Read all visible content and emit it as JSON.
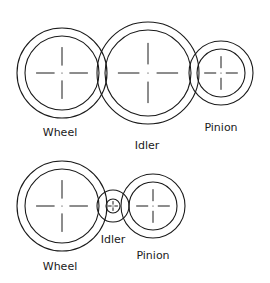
{
  "diagram": {
    "top_train": {
      "gears": [
        {
          "name": "Wheel",
          "cx": 62,
          "cy": 73,
          "r_outer": 45,
          "r_inner": 37,
          "label_x": 60,
          "label_y": 136
        },
        {
          "name": "Idler",
          "cx": 148,
          "cy": 73,
          "r_outer": 51,
          "r_inner": 43,
          "label_x": 147,
          "label_y": 149
        },
        {
          "name": "Pinion",
          "cx": 221,
          "cy": 73,
          "r_outer": 32,
          "r_inner": 24,
          "label_x": 221,
          "label_y": 131
        }
      ]
    },
    "bottom_train": {
      "gears": [
        {
          "name": "Wheel",
          "cx": 62,
          "cy": 206,
          "r_outer": 45,
          "r_inner": 37,
          "label_x": 60,
          "label_y": 270
        },
        {
          "name": "Idler",
          "cx": 113,
          "cy": 206,
          "r_outer": 16,
          "r_inner": 7,
          "label_x": 113,
          "label_y": 243
        },
        {
          "name": "Pinion",
          "cx": 153,
          "cy": 206,
          "r_outer": 32,
          "r_inner": 24,
          "label_x": 153,
          "label_y": 259
        }
      ]
    },
    "colors": {
      "stroke": "#1a1a1a",
      "background": "#ffffff"
    }
  }
}
